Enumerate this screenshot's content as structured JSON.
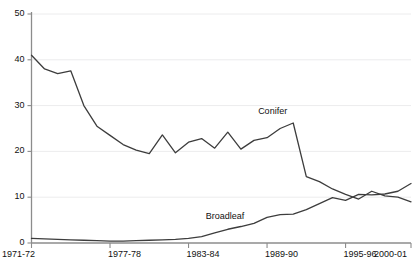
{
  "chart_data": {
    "type": "line",
    "title": "",
    "subtitle": "",
    "xlabel": "",
    "ylabel": "",
    "grid": true,
    "legend_position": "inline-annotation",
    "xlim": [
      0,
      29
    ],
    "ylim": [
      0,
      50
    ],
    "yticks": [
      0,
      10,
      20,
      30,
      40,
      50
    ],
    "ytick_labels": [
      "0",
      "10",
      "20",
      "30",
      "40",
      "50"
    ],
    "x": [
      "1971-72",
      "1972-73",
      "1973-74",
      "1974-75",
      "1975-76",
      "1976-77",
      "1977-78",
      "1978-79",
      "1979-80",
      "1980-81",
      "1981-82",
      "1982-83",
      "1983-84",
      "1984-85",
      "1985-86",
      "1986-87",
      "1987-88",
      "1988-89",
      "1989-90",
      "1990-91",
      "1991-92",
      "1992-93",
      "1993-94",
      "1994-95",
      "1995-96",
      "1996-97",
      "1997-98",
      "1998-99",
      "1999-00",
      "2000-01"
    ],
    "xtick_labels": [
      "1971-72",
      "1977-78",
      "1983-84",
      "1989-90",
      "1995-96",
      "2000-01"
    ],
    "xtick_indices": [
      0,
      6,
      12,
      18,
      24,
      29
    ],
    "series": [
      {
        "name": "Conifer",
        "color": "#3d3d3d",
        "annotation": "Conifer",
        "values": [
          41.0,
          38.0,
          37.0,
          37.6,
          30.0,
          25.5,
          23.5,
          21.5,
          20.3,
          19.5,
          23.6,
          19.7,
          22.0,
          22.8,
          20.7,
          24.2,
          20.5,
          22.4,
          23.0,
          25.0,
          26.2,
          14.5,
          13.4,
          11.8,
          10.6,
          9.6,
          11.3,
          10.3,
          10.0,
          9.0
        ]
      },
      {
        "name": "Broadleaf",
        "color": "#3d3d3d",
        "annotation": "Broadleaf",
        "values": [
          1.0,
          0.9,
          0.8,
          0.7,
          0.6,
          0.5,
          0.4,
          0.4,
          0.5,
          0.6,
          0.7,
          0.8,
          1.0,
          1.4,
          2.2,
          3.0,
          3.6,
          4.3,
          5.6,
          6.2,
          6.3,
          7.3,
          8.6,
          9.9,
          9.3,
          10.6,
          10.5,
          10.7,
          11.3,
          13.0
        ]
      }
    ],
    "annotations": [
      {
        "text": "Conifer",
        "x_index": 19,
        "y_value": 28.5
      },
      {
        "text": "Broadleaf",
        "x_index": 15,
        "y_value": 5.6
      }
    ],
    "colors": {
      "line": "#3d3d3d",
      "axis": "#8c8c8c",
      "grid": "#ececed",
      "text": "#111111",
      "background": "#ffffff"
    }
  }
}
